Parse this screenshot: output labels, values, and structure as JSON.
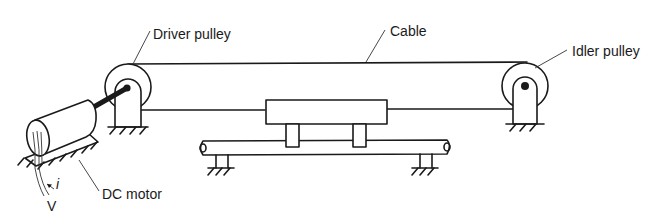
{
  "diagram": {
    "title": "",
    "labels": {
      "driver_pulley": "Driver pulley",
      "cable": "Cable",
      "idler_pulley": "Idler pulley",
      "dc_motor": "DC motor",
      "current": "i",
      "voltage": "V"
    },
    "components": [
      {
        "id": "dc-motor",
        "name": "DC motor"
      },
      {
        "id": "driver-pulley",
        "name": "Driver pulley"
      },
      {
        "id": "idler-pulley",
        "name": "Idler pulley"
      },
      {
        "id": "cable",
        "name": "Cable"
      },
      {
        "id": "carriage",
        "name": "Carriage"
      },
      {
        "id": "guide-rail",
        "name": "Guide rail"
      }
    ]
  }
}
